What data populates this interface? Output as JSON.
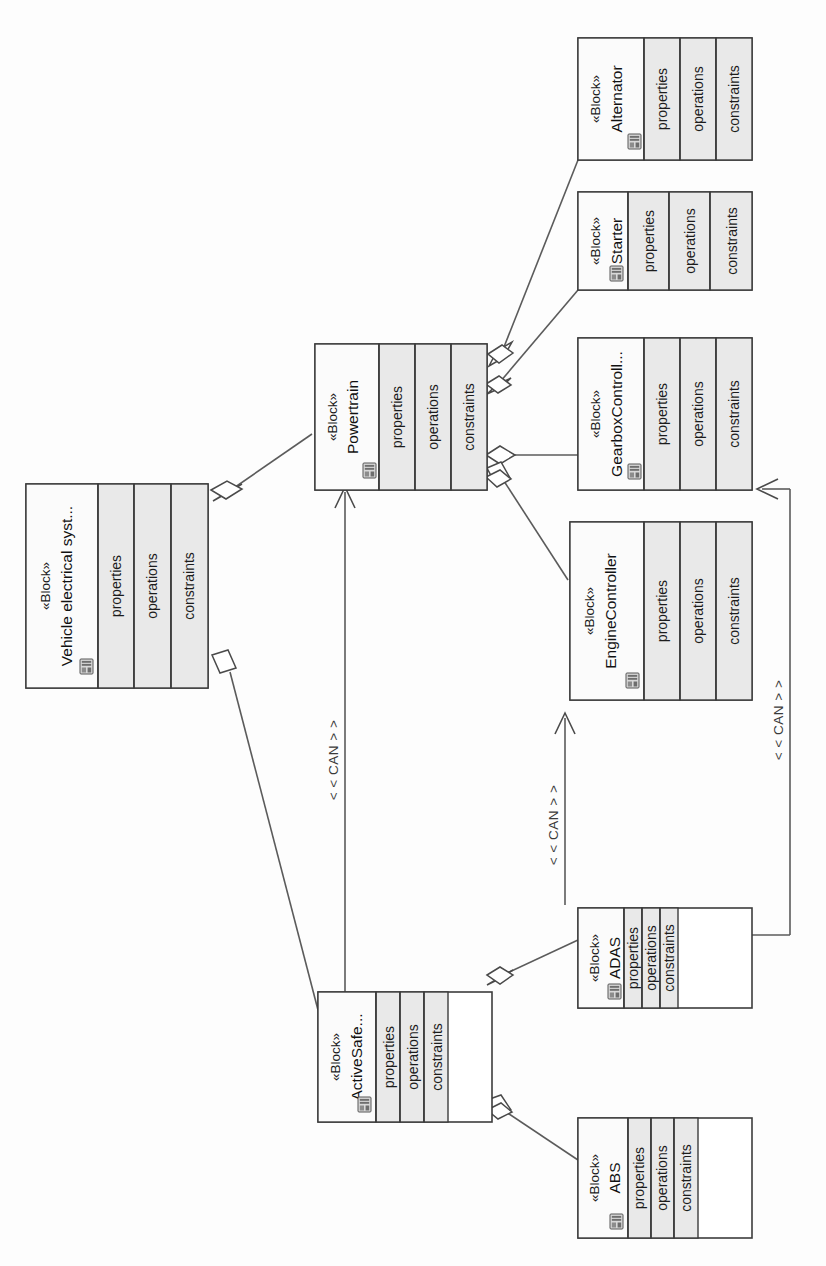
{
  "diagram": {
    "kind": "sysml-block-definition-diagram",
    "orientation": "rotated-90-clockwise",
    "background_color": "#fdfdfd",
    "line_color": "#4a4a4a",
    "compartment_fill": "#e9e9e9",
    "header_fill": "#ffffff"
  },
  "compartment_labels": {
    "properties": "properties",
    "operations": "operations",
    "constraints": "constraints"
  },
  "stereotype": "«Block»",
  "blocks": [
    {
      "id": "vehicle-electrical-system",
      "stereotype": "«Block»",
      "name": "Vehicle electrical syst...",
      "icon": "block-icon",
      "compartments": [
        "properties",
        "operations",
        "constraints"
      ]
    },
    {
      "id": "powertrain",
      "stereotype": "«Block»",
      "name": "Powertrain",
      "icon": "block-icon",
      "compartments": [
        "properties",
        "operations",
        "constraints"
      ]
    },
    {
      "id": "alternator",
      "stereotype": "«Block»",
      "name": "Alternator",
      "icon": "block-icon",
      "compartments": [
        "properties",
        "operations",
        "constraints"
      ]
    },
    {
      "id": "starter",
      "stereotype": "«Block»",
      "name": "Starter",
      "icon": "block-icon",
      "compartments": [
        "properties",
        "operations",
        "constraints"
      ]
    },
    {
      "id": "gearbox-controller",
      "stereotype": "«Block»",
      "name": "GearboxControll...",
      "icon": "block-icon",
      "compartments": [
        "properties",
        "operations",
        "constraints"
      ]
    },
    {
      "id": "engine-controller",
      "stereotype": "«Block»",
      "name": "EngineController",
      "icon": "block-icon",
      "compartments": [
        "properties",
        "operations",
        "constraints"
      ]
    },
    {
      "id": "active-safety",
      "stereotype": "«Block»",
      "name": "ActiveSafe...",
      "icon": "block-icon",
      "compartments": [
        "properties",
        "operations",
        "constraints"
      ]
    },
    {
      "id": "adas",
      "stereotype": "«Block»",
      "name": "ADAS",
      "icon": "block-icon",
      "compartments": [
        "properties",
        "operations",
        "constraints"
      ]
    },
    {
      "id": "abs",
      "stereotype": "«Block»",
      "name": "ABS",
      "icon": "block-icon",
      "compartments": [
        "properties",
        "operations",
        "constraints"
      ]
    }
  ],
  "edges": [
    {
      "id": "ves-powertrain",
      "type": "aggregation",
      "from": "vehicle-electrical-system",
      "to": "powertrain",
      "label": ""
    },
    {
      "id": "ves-activesafety",
      "type": "aggregation",
      "from": "vehicle-electrical-system",
      "to": "active-safety",
      "label": ""
    },
    {
      "id": "powertrain-alternator",
      "type": "aggregation",
      "from": "powertrain",
      "to": "alternator",
      "label": ""
    },
    {
      "id": "powertrain-starter",
      "type": "aggregation",
      "from": "powertrain",
      "to": "starter",
      "label": ""
    },
    {
      "id": "powertrain-gearboxcontroller",
      "type": "aggregation",
      "from": "powertrain",
      "to": "gearbox-controller",
      "label": ""
    },
    {
      "id": "powertrain-enginecontroller",
      "type": "aggregation",
      "from": "powertrain",
      "to": "engine-controller",
      "label": ""
    },
    {
      "id": "activesafety-adas",
      "type": "aggregation",
      "from": "active-safety",
      "to": "adas",
      "label": ""
    },
    {
      "id": "activesafety-abs",
      "type": "aggregation",
      "from": "active-safety",
      "to": "abs",
      "label": ""
    },
    {
      "id": "activesafety-powertrain-can",
      "type": "directed-connector",
      "from": "active-safety",
      "to": "powertrain",
      "label": "< < CAN > >"
    },
    {
      "id": "adas-enginecontroller-can",
      "type": "directed-connector",
      "from": "adas",
      "to": "engine-controller",
      "label": "< < CAN > >"
    },
    {
      "id": "adas-gearboxcontroller-can",
      "type": "directed-connector",
      "from": "adas",
      "to": "gearbox-controller",
      "label": "< < CAN > >"
    }
  ]
}
